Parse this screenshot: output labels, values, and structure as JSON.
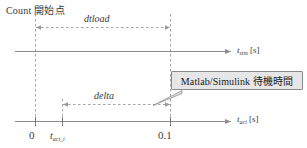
{
  "diagram": {
    "title_label": "Count 開始点",
    "callout": {
      "text": "Matlab/Simulink 待機時間"
    },
    "dimensions": [
      {
        "name": "dtload",
        "label": "dtload"
      },
      {
        "name": "delta",
        "label": "delta"
      }
    ],
    "axes": [
      {
        "name": "sim-time-axis",
        "symbol": "t",
        "subscript": "sim",
        "unit": "[s]"
      },
      {
        "name": "act-time-axis",
        "symbol": "t",
        "subscript": "act",
        "unit": "[s]"
      }
    ],
    "ticks": [
      {
        "name": "origin",
        "label": "0"
      },
      {
        "name": "t-act-i",
        "symbol": "t",
        "subscript": "act_i"
      },
      {
        "name": "zero-point-one",
        "label": "0.1"
      }
    ],
    "colors": {
      "line": "#8c8c8c",
      "dashed": "#9a9a9a",
      "text": "#3a3a3a",
      "callout_fill": "#e6e6e6",
      "callout_border": "#8a8a8a"
    }
  }
}
